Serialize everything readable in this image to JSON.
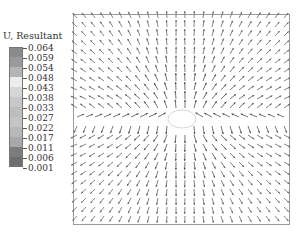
{
  "legend": {
    "title": "U, Resultant",
    "values": [
      "0.064",
      "0.059",
      "0.054",
      "0.048",
      "0.043",
      "0.038",
      "0.033",
      "0.027",
      "0.022",
      "0.017",
      "0.011",
      "0.006",
      "0.001"
    ],
    "swatch_colors": [
      "#8a8a8a",
      "#9a9a9a",
      "#b4b4b4",
      "#ededed",
      "#d6d6d6",
      "#c8c8c8",
      "#bdbdbd",
      "#c4c4c4",
      "#b8b8b8",
      "#a8a8a8",
      "#7c7c7c",
      "#6e6e6e"
    ]
  },
  "plot": {
    "border_color": "#9a9a9a",
    "arrow_color": "#555555",
    "hole": {
      "cx": 109,
      "cy": 105,
      "rx": 14,
      "ry": 9
    },
    "grid_step": 9,
    "description": "Displacement vector field around a central elliptical hole; arrows radiate away from hole, curving in lobes above and below"
  }
}
